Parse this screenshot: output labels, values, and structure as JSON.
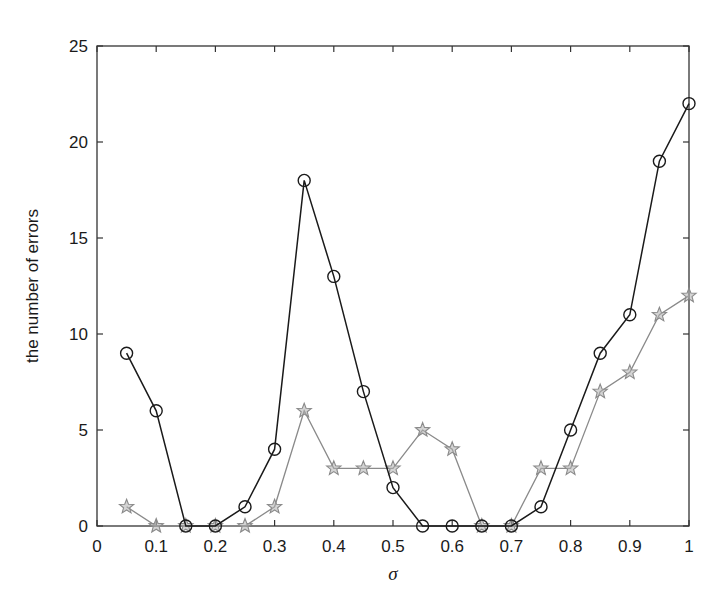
{
  "chart_data": {
    "type": "line",
    "title": "",
    "xlabel": "σ",
    "ylabel": "the number of errors",
    "xlim": [
      0,
      1
    ],
    "ylim": [
      0,
      25
    ],
    "xticks": [
      0,
      0.1,
      0.2,
      0.3,
      0.4,
      0.5,
      0.6,
      0.7,
      0.8,
      0.9,
      1
    ],
    "xtick_labels": [
      "0",
      "0.1",
      "0.2",
      "0.3",
      "0.4",
      "0.5",
      "0.6",
      "0.7",
      "0.8",
      "0.9",
      "1"
    ],
    "yticks": [
      0,
      5,
      10,
      15,
      20,
      25
    ],
    "ytick_labels": [
      "0",
      "5",
      "10",
      "15",
      "20",
      "25"
    ],
    "grid": false,
    "legend": null,
    "x": [
      0.05,
      0.1,
      0.15,
      0.2,
      0.25,
      0.3,
      0.35,
      0.4,
      0.45,
      0.5,
      0.55,
      0.6,
      0.65,
      0.7,
      0.75,
      0.8,
      0.85,
      0.9,
      0.95,
      1.0
    ],
    "series": [
      {
        "name": "circles (black)",
        "marker": "circle",
        "color": "#1a1a1a",
        "values": [
          9,
          6,
          0,
          0,
          1,
          4,
          18,
          13,
          7,
          2,
          0,
          0,
          0,
          0,
          1,
          5,
          9,
          11,
          19,
          22
        ]
      },
      {
        "name": "stars (gray)",
        "marker": "star",
        "color": "#8a8a8a",
        "values": [
          1,
          0,
          0,
          0,
          0,
          1,
          6,
          3,
          3,
          3,
          5,
          4,
          0,
          0,
          3,
          3,
          7,
          8,
          11,
          12
        ]
      }
    ]
  }
}
